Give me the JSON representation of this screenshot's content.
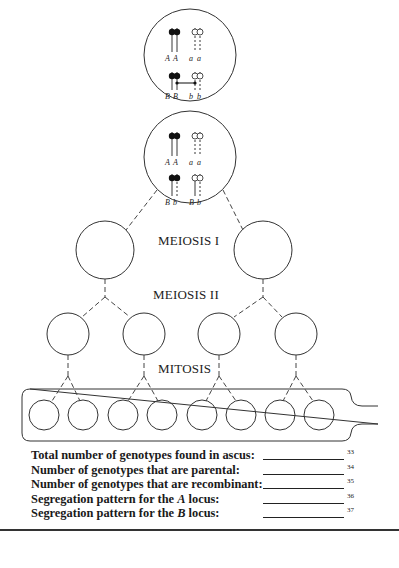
{
  "diagram": {
    "stages": {
      "meiosis_1": "MEIOSIS I",
      "meiosis_2": "MEIOSIS II",
      "mitosis": "MITOSIS"
    },
    "top_cell": {
      "locus_a_labels": [
        "A",
        "A",
        "a",
        "a"
      ],
      "locus_b_labels": [
        "B",
        "B",
        "b",
        "b"
      ],
      "note": "crossover between inner B and b chromatids"
    },
    "second_cell": {
      "locus_a_labels": [
        "A",
        "A",
        "a",
        "a"
      ],
      "locus_b_labels": [
        "B",
        "b",
        "B",
        "b"
      ]
    },
    "meiosis_1_products": 2,
    "meiosis_2_products": 4,
    "ascospores": 8,
    "colors": {
      "line": "#333333",
      "background": "#ffffff"
    }
  },
  "questions": [
    {
      "label": "Total number of genotypes found in ascus:",
      "number": "33"
    },
    {
      "label": "Number of genotypes that are parental:",
      "number": "34"
    },
    {
      "label": "Number of genotypes that are recombinant:",
      "number": "35"
    },
    {
      "label_prefix": "Segregation pattern for the ",
      "locus": "A",
      "label_suffix": " locus:",
      "number": "36"
    },
    {
      "label_prefix": "Segregation pattern for the ",
      "locus": "B",
      "label_suffix": " locus:",
      "number": "37"
    }
  ]
}
